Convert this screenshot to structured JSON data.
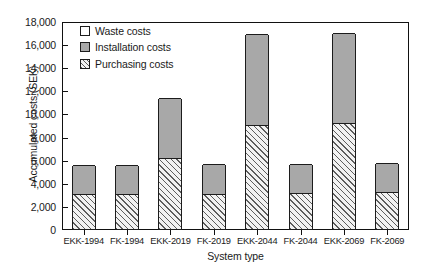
{
  "chart_data": {
    "type": "bar",
    "title": "",
    "subtitle": "",
    "xlabel": "System type",
    "ylabel": "Accumulated costs (SEK)",
    "ylim": [
      0,
      18000
    ],
    "ytick_step": 2000,
    "ytick_labels": [
      "0",
      "2,000",
      "4,000",
      "6,000",
      "8,000",
      "10,000",
      "12,000",
      "14,000",
      "16,000",
      "18,000"
    ],
    "ytick_values": [
      0,
      2000,
      4000,
      6000,
      8000,
      10000,
      12000,
      14000,
      16000,
      18000
    ],
    "grid": false,
    "stacked": true,
    "legend_position": "inside top-left",
    "categories": [
      "EKK-1994",
      "FK-1994",
      "EKK-2019",
      "FK-2019",
      "EKK-2044",
      "FK-2044",
      "EKK-2069",
      "FK-2069"
    ],
    "series": [
      {
        "name": "Purchasing costs",
        "color": "#f2f2f2",
        "pattern": "diagonal-hatch",
        "values": [
          2950,
          2950,
          6100,
          2950,
          8950,
          3050,
          9050,
          3100
        ]
      },
      {
        "name": "Installation costs",
        "color": "#a8a8a8",
        "pattern": "solid-gray",
        "values": [
          2550,
          2600,
          5200,
          2700,
          7950,
          2550,
          7950,
          2650
        ]
      },
      {
        "name": "Waste costs",
        "color": "#ffffff",
        "pattern": "solid-white",
        "values": [
          0,
          0,
          0,
          0,
          0,
          0,
          0,
          0
        ]
      }
    ],
    "totals": [
      5500,
      5550,
      11300,
      5650,
      16900,
      5600,
      17000,
      5750
    ]
  },
  "legend": {
    "items": [
      {
        "label": "Waste costs",
        "swatch": "white"
      },
      {
        "label": "Installation costs",
        "swatch": "gray"
      },
      {
        "label": "Purchasing costs",
        "swatch": "hatched"
      }
    ]
  },
  "axes": {
    "y_title": "Accumulated costs (SEK)",
    "x_title": "System type"
  },
  "colors": {
    "axis": "#111111",
    "installation": "#a8a8a8",
    "purchasing_fill": "#f2f2f2",
    "purchasing_hatch": "#5d5d5d",
    "waste": "#ffffff",
    "background": "#ffffff"
  }
}
